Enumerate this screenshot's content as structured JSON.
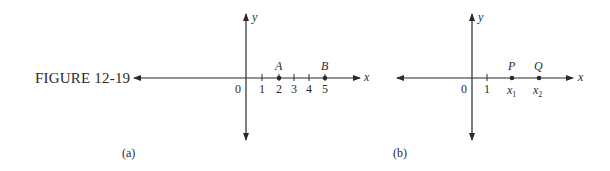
{
  "figure": {
    "label": "FIGURE 12-19",
    "panels": [
      {
        "id": "a",
        "caption": "(a)",
        "axis_labels": {
          "x": "x",
          "y": "y",
          "origin": "0"
        },
        "ticks": [
          "1",
          "2",
          "3",
          "4",
          "5"
        ],
        "points": [
          {
            "name": "A",
            "at": "2"
          },
          {
            "name": "B",
            "at": "5"
          }
        ]
      },
      {
        "id": "b",
        "caption": "(b)",
        "axis_labels": {
          "x": "x",
          "y": "y",
          "origin": "0"
        },
        "ticks": [
          "1"
        ],
        "points": [
          {
            "name": "P",
            "at": "x1",
            "sub": "1"
          },
          {
            "name": "Q",
            "at": "x2",
            "sub": "2"
          }
        ]
      }
    ]
  }
}
